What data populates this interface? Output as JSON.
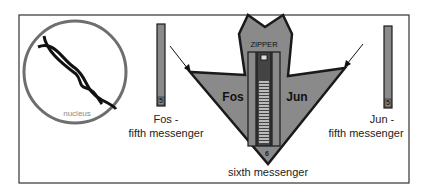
{
  "diagram": {
    "nucleus": {
      "label": "nucleus"
    },
    "fos_messenger": {
      "name": "Fos -",
      "role": "fifth messenger",
      "badge": "5"
    },
    "jun_messenger": {
      "name": "Jun -",
      "role": "fifth messenger",
      "badge": "5"
    },
    "complex": {
      "zipper_label": "ZIPPER",
      "left_label": "Fos",
      "right_label": "Jun",
      "badge": "6",
      "caption": "sixth messenger"
    }
  },
  "colors": {
    "fill_gray": "#8a8a8a",
    "stroke": "#1a1a1a",
    "nucleus_ring": "#6e6e6e",
    "frame": "#333333"
  }
}
